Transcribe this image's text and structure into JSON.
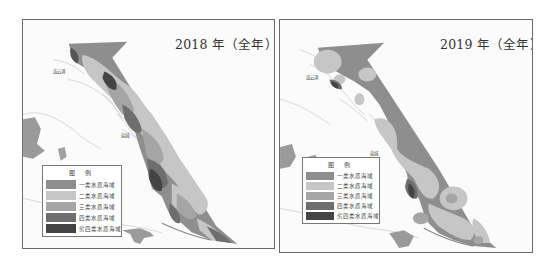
{
  "maps": [
    {
      "year": "2018",
      "title": "2018 年（全年）",
      "place_labels": [
        "连云港",
        "盐城"
      ],
      "legend": {
        "title": "图 例",
        "items": [
          {
            "label": "一类水质海域",
            "color": "#8e8e8e"
          },
          {
            "label": "二类水质海域",
            "color": "#c6c6c6"
          },
          {
            "label": "三类水质海域",
            "color": "#a5a5a5"
          },
          {
            "label": "四类水质海域",
            "color": "#6e6e6e"
          },
          {
            "label": "劣四类水质海域",
            "color": "#444444"
          }
        ]
      }
    },
    {
      "year": "2019",
      "title": "2019 年（全年）",
      "place_labels": [
        "连云港",
        "盐城"
      ],
      "legend": {
        "title": "图 例",
        "items": [
          {
            "label": "一类水质海域",
            "color": "#8e8e8e"
          },
          {
            "label": "二类水质海域",
            "color": "#c6c6c6"
          },
          {
            "label": "三类水质海域",
            "color": "#a5a5a5"
          },
          {
            "label": "四类水质海域",
            "color": "#6e6e6e"
          },
          {
            "label": "劣四类水质海域",
            "color": "#444444"
          }
        ]
      }
    }
  ]
}
